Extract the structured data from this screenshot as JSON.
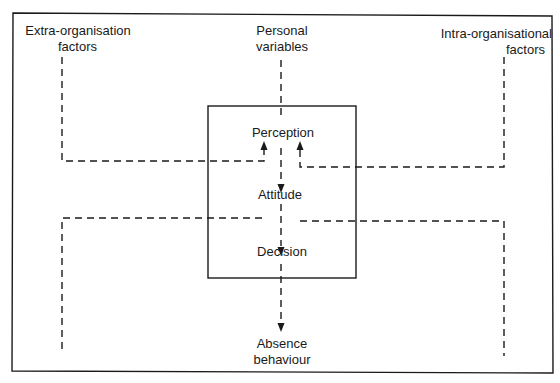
{
  "diagram": {
    "title": "",
    "nodes": {
      "extra_org": {
        "line1": "Extra-organisation",
        "line2": "factors"
      },
      "personal": {
        "line1": "Personal",
        "line2": "variables"
      },
      "intra_org": {
        "line1": "Intra-organisational",
        "line2": "factors"
      },
      "perception": {
        "label": "Perception"
      },
      "attitude": {
        "label": "Attitude"
      },
      "decision": {
        "label": "Decision"
      },
      "absence": {
        "line1": "Absence",
        "line2": "behaviour"
      }
    },
    "colors": {
      "line": "#1a1a1a",
      "background": "#ffffff"
    }
  }
}
